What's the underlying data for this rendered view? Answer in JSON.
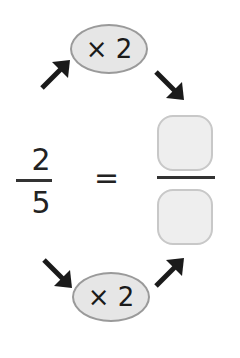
{
  "top_operator": {
    "label": "× 2"
  },
  "bottom_operator": {
    "label": "× 2"
  },
  "left_fraction": {
    "numerator": "2",
    "denominator": "5"
  },
  "equals": "=",
  "right_fraction": {
    "numerator": "",
    "denominator": ""
  },
  "colors": {
    "oval_fill": "#e6e6e6",
    "oval_border": "#9a9a9a",
    "box_fill": "#eeeeee",
    "box_border": "#c8c8c8",
    "ink": "#1a1a1a"
  }
}
